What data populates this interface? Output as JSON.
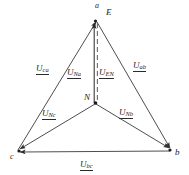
{
  "figure": {
    "type": "phasor-diagram",
    "background_color": "#ffffff",
    "line_color": "#3a3a3a",
    "label_color": "#2a2a2a"
  },
  "nodes": [
    {
      "id": "a",
      "label": "a",
      "x": 95,
      "y": 12,
      "name": "node-a"
    },
    {
      "id": "E",
      "label": "E",
      "x": 106,
      "y": 15,
      "name": "node-e"
    },
    {
      "id": "N",
      "label": "N",
      "x": 88,
      "y": 101,
      "name": "node-n"
    },
    {
      "id": "c",
      "label": "c",
      "x": 11,
      "y": 157,
      "name": "node-c"
    },
    {
      "id": "b",
      "label": "b",
      "x": 174,
      "y": 155,
      "name": "node-b"
    }
  ],
  "vectors": [
    {
      "id": "Uca",
      "symbol": "U",
      "subscript": "ca",
      "label": "Uca",
      "from": "c",
      "to": "a",
      "x": 43,
      "y": 68,
      "name": "vector-label-uca"
    },
    {
      "id": "Uab",
      "symbol": "U",
      "subscript": "ab",
      "label": "Uab",
      "from": "a",
      "to": "b",
      "x": 137,
      "y": 65,
      "name": "vector-label-uab"
    },
    {
      "id": "UNa",
      "symbol": "U",
      "subscript": "Na",
      "label": "UNa",
      "from": "N",
      "to": "a",
      "x": 74,
      "y": 72,
      "name": "vector-label-una"
    },
    {
      "id": "UEN",
      "symbol": "U",
      "subscript": "EN",
      "label": "UEN",
      "from": "E",
      "to": "N",
      "x": 98,
      "y": 72,
      "name": "vector-label-uen"
    },
    {
      "id": "UNc",
      "symbol": "U",
      "subscript": "Nc",
      "label": "UNc",
      "from": "N",
      "to": "c",
      "x": 47,
      "y": 113,
      "name": "vector-label-unc"
    },
    {
      "id": "UNb",
      "symbol": "U",
      "subscript": "Nb",
      "label": "UNb",
      "from": "N",
      "to": "b",
      "x": 123,
      "y": 112,
      "name": "vector-label-unb"
    },
    {
      "id": "Ubc",
      "symbol": "U",
      "subscript": "bc",
      "label": "Ubc",
      "from": "b",
      "to": "c",
      "x": 84,
      "y": 164,
      "name": "vector-label-ubc"
    }
  ]
}
